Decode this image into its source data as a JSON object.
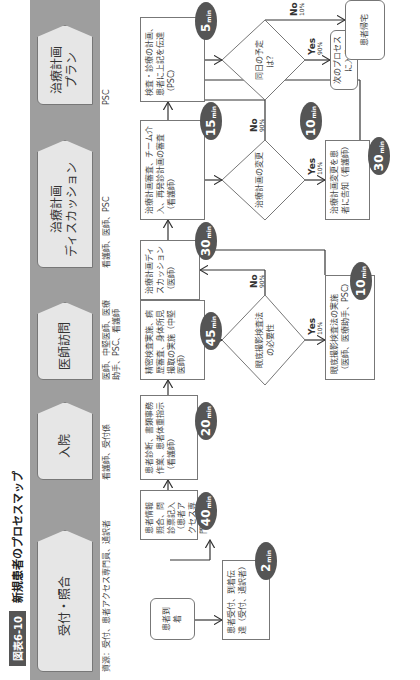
{
  "figure": {
    "badge": "図表6-10",
    "title": "新規患者のプロセスマップ"
  },
  "stages": [
    {
      "label": "受付・照合",
      "resources": "資源：受付、患者アクセス専門員、通訳者"
    },
    {
      "label": "入院",
      "resources": "看護師、受付係"
    },
    {
      "label": "医師訪問",
      "resources": "医師、中堅医師、医療助手、PSC、看護師"
    },
    {
      "label": "治療計画\nディスカッション",
      "resources": "看護師、医師、PSC"
    },
    {
      "label": "治療計画\nプラン",
      "resources": "PSC"
    }
  ],
  "nodes": {
    "arrival": "患者到着",
    "reception": "患者受付、到着伝達（受付、通訳者）",
    "info_check": "患者情報照合、問診票記入（患者アクセス専門員）",
    "intake": "患者診断、書類事務作業、患者体重指示（看護師）",
    "exam": "精密検査実施、病歴審査、身体所見撮取の実施（中堅医師）",
    "diag_decision": "眼底撮影検査法の必要性",
    "diag_exec": "眼底撮影検査法の実施（医師、医療助手、PSC）",
    "discussion": "治療計画ディスカッション（医師）",
    "plan_review": "治療計画審査、チーム介入、再発診計画の審査（看護師）",
    "clean_room": "クリーンルーム、書類事務作業、治療計画の改訂、変更に対するEメールまたはボイスメールのチェック（看護師）",
    "plan_change_decision": "治療計画の変更",
    "plan_change_notify": "治療計画変更を患者に告知（看護師）",
    "final": "検査・診療の計画、患者に上記を伝達（PSC）",
    "same_day_decision": "同日の予定は？",
    "next_process": "次のプロセスに入る",
    "patient_wait": "患者帰宅"
  },
  "times": {
    "reception": "2",
    "info_check": "40",
    "intake": "20",
    "exam": "45",
    "diag_exec": "10",
    "discussion": "30",
    "plan_review": "15",
    "clean_room": "10",
    "plan_change_notify": "30",
    "final": "5",
    "unit": "min"
  },
  "branches": {
    "diag_yes": {
      "label": "Yes",
      "pct": "10%"
    },
    "diag_no": {
      "label": "No",
      "pct": "90%"
    },
    "change_yes": {
      "label": "Yes",
      "pct": "10%"
    },
    "change_no": {
      "label": "No",
      "pct": "90%"
    },
    "same_day_yes": {
      "label": "Yes",
      "pct": "90%"
    },
    "same_day_no": {
      "label": "No",
      "pct": "10%"
    }
  }
}
